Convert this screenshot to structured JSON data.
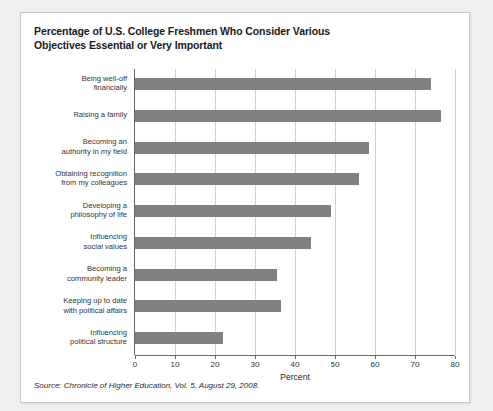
{
  "card": {
    "title_lines": [
      "Percentage of U.S. College Freshmen Who Consider Various",
      "Objectives Essential or Very Important"
    ],
    "source": "Source: Chronicle of Higher Education, Vol. 5, August 29, 2008."
  },
  "colors": {
    "bar_fill": "#808080",
    "gridline": "#d2d2d2",
    "axis": "#666666",
    "card_background": "#ffffff",
    "page_background": "#f0f0f0"
  },
  "chart_data": {
    "type": "bar",
    "orientation": "horizontal",
    "title": "Percentage of U.S. College Freshmen Who Consider Various Objectives Essential or Very Important",
    "xlabel": "Percent",
    "ylabel": "",
    "xlim": [
      0,
      80
    ],
    "xticks": [
      0,
      10,
      20,
      30,
      40,
      50,
      60,
      70,
      80
    ],
    "grid": "vertical",
    "legend": "none",
    "categories": [
      "Being well-off financially",
      "Raising a family",
      "Becoming an authority in my field",
      "Obtaining recognition from my colleagues",
      "Developing a philosophy of life",
      "Influencing social values",
      "Becoming a community leader",
      "Keeping up to date with political affairs",
      "Influencing political structure"
    ],
    "category_lines": [
      [
        "Being well-off",
        "financially"
      ],
      [
        "Raising a family"
      ],
      [
        "Becoming an",
        "authority in my field"
      ],
      [
        "Obtaining recognition",
        "from my colleagues"
      ],
      [
        "Developing a",
        "philosophy of life"
      ],
      [
        "Influencing",
        "social values"
      ],
      [
        "Becoming a",
        "community leader"
      ],
      [
        "Keeping up to date",
        "with political affairs"
      ],
      [
        "Influencing",
        "political structure"
      ]
    ],
    "values": [
      74,
      76.5,
      58.5,
      56,
      49,
      44,
      35.5,
      36.5,
      22
    ]
  }
}
